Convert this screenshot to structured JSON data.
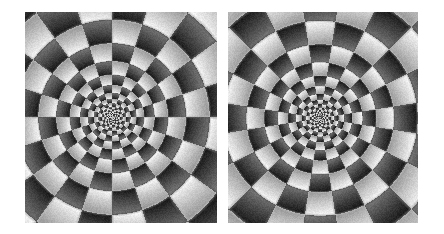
{
  "figure": {
    "kind": "optical-illusion-figure",
    "title": "Two polar checkerboard illusion patterns",
    "background_color": "#ffffff",
    "width": 444,
    "height": 234,
    "panel_count": 2,
    "caption": ""
  },
  "panels": [
    {
      "id": "panel-left",
      "label": "Left illusion pattern",
      "x": 25,
      "y": 12,
      "width": 192,
      "height": 211,
      "center_x": 112,
      "center_y": 117,
      "pattern": {
        "type": "log-polar-checkerboard",
        "angular_sectors": 20,
        "ring_count": 13,
        "ring_growth_factor": 1.32,
        "inner_radius": 2.0,
        "gradient_direction": "radial-within-cell",
        "phase_offset_deg": 0,
        "ring_phase_alternates": true,
        "dark_value": "#1a1a1a",
        "light_value": "#f5f5f5",
        "mid_value": "#7a7a7a",
        "noise_amount": 0.07,
        "gradient_polarity": 1
      }
    },
    {
      "id": "panel-right",
      "label": "Right illusion pattern",
      "x": 228,
      "y": 12,
      "width": 190,
      "height": 211,
      "center_x": 320,
      "center_y": 118,
      "pattern": {
        "type": "log-polar-checkerboard",
        "angular_sectors": 20,
        "ring_count": 13,
        "ring_growth_factor": 1.32,
        "inner_radius": 2.0,
        "gradient_direction": "radial-within-cell",
        "phase_offset_deg": 9,
        "ring_phase_alternates": true,
        "dark_value": "#1a1a1a",
        "light_value": "#f5f5f5",
        "mid_value": "#7a7a7a",
        "noise_amount": 0.07,
        "gradient_polarity": -1
      }
    }
  ]
}
